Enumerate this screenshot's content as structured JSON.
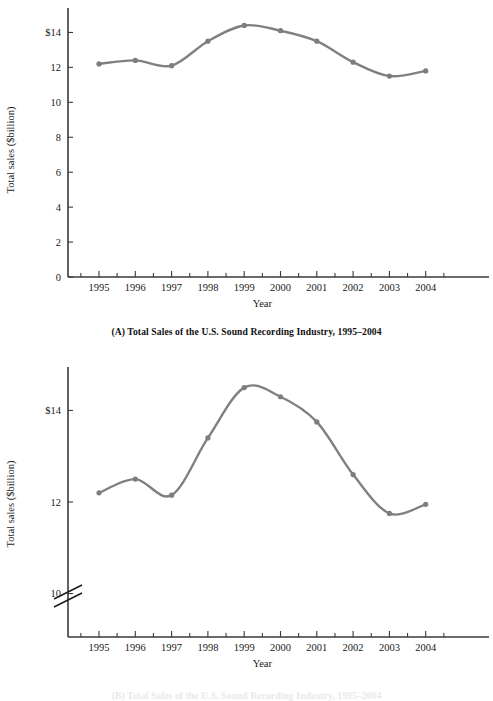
{
  "figure_a": {
    "caption": "(A) Total Sales of the U.S. Sound Recording Industry, 1995–2004",
    "y_axis_title": "Total sales ($billion)",
    "x_axis_title": "Year"
  },
  "figure_b": {
    "caption": "(B) Total Sales of the U.S. Sound Recording Industry, 1995–2004",
    "y_axis_title": "Total sales ($billion)",
    "x_axis_title": "Year"
  },
  "chart_data": [
    {
      "id": "chart-a",
      "type": "line",
      "title": "(A) Total Sales of the U.S. Sound Recording Industry, 1995–2004",
      "xlabel": "Year",
      "ylabel": "Total sales ($billion)",
      "categories": [
        1995,
        1996,
        1997,
        1998,
        1999,
        2000,
        2001,
        2002,
        2003,
        2004
      ],
      "x_tick_labels": [
        "1995",
        "1996",
        "1997",
        "1998",
        "1999",
        "2000",
        "2001",
        "2002",
        "2003",
        "2004"
      ],
      "values": [
        12.2,
        12.4,
        12.1,
        13.5,
        14.4,
        14.1,
        13.5,
        12.3,
        11.5,
        11.8
      ],
      "y_ticks": [
        0,
        2,
        4,
        6,
        8,
        10,
        12,
        14
      ],
      "y_tick_labels": [
        "0",
        "2",
        "4",
        "6",
        "8",
        "10",
        "12",
        "$14"
      ],
      "ylim": [
        0,
        15.4
      ],
      "grid": false,
      "legend": "none",
      "axis_break": false,
      "line_color": "#808080",
      "marker_color": "#7d7d7d"
    },
    {
      "id": "chart-b",
      "type": "line",
      "title": "(B) Total Sales of the U.S. Sound Recording Industry, 1995–2004",
      "xlabel": "Year",
      "ylabel": "Total sales ($billion)",
      "categories": [
        1995,
        1996,
        1997,
        1998,
        1999,
        2000,
        2001,
        2002,
        2003,
        2004
      ],
      "x_tick_labels": [
        "1995",
        "1996",
        "1997",
        "1998",
        "1999",
        "2000",
        "2001",
        "2002",
        "2003",
        "2004"
      ],
      "values": [
        12.2,
        12.5,
        12.15,
        13.4,
        14.5,
        14.3,
        13.75,
        12.6,
        11.75,
        11.95
      ],
      "y_ticks": [
        10,
        12,
        14
      ],
      "y_tick_labels": [
        "10",
        "12",
        "$14"
      ],
      "ylim": [
        9.05,
        14.95
      ],
      "grid": false,
      "legend": "none",
      "axis_break": true,
      "axis_break_note": "double-slash break on vertical axis below 10",
      "line_color": "#808080",
      "marker_color": "#7d7d7d"
    }
  ]
}
